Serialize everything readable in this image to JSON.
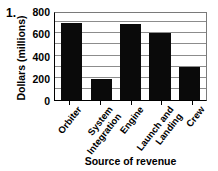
{
  "item_number": "1.",
  "chart_data": {
    "type": "bar",
    "title": "",
    "xlabel": "Source of revenue",
    "ylabel": "Dollars (millions)",
    "ylim": [
      0,
      800
    ],
    "ytick_values": [
      0,
      200,
      400,
      600,
      800
    ],
    "ytick_labels": [
      "0",
      "200",
      "400",
      "600",
      "800"
    ],
    "gridlines": [
      100,
      200,
      300,
      400,
      500,
      600,
      700
    ],
    "grid": true,
    "legend": "none",
    "bar_color": "#0a0a0a",
    "categories": [
      "Orbiter",
      "System Integration",
      "Engine",
      "Launch and Landing",
      "Crew"
    ],
    "category_lines": [
      [
        "Orbiter",
        ""
      ],
      [
        "System",
        "Integration"
      ],
      [
        "Engine",
        ""
      ],
      [
        "Launch and",
        "Landing"
      ],
      [
        "Crew",
        ""
      ]
    ],
    "values": [
      690,
      185,
      680,
      600,
      300
    ]
  }
}
